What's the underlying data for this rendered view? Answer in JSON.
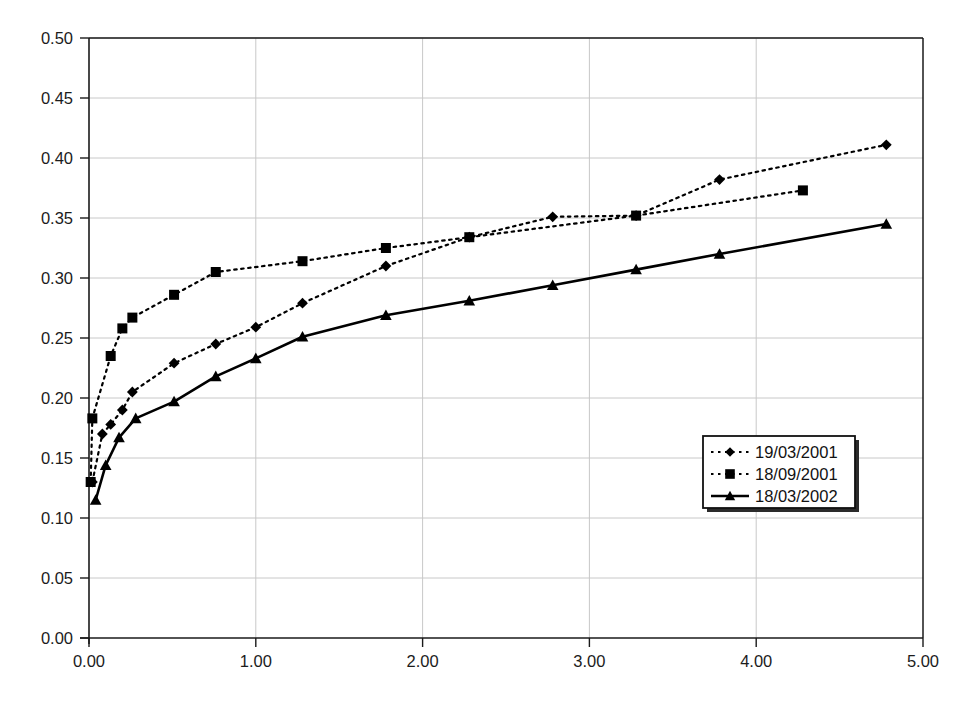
{
  "chart_data": {
    "type": "line",
    "title": "",
    "xlabel": "",
    "ylabel": "",
    "xlim": [
      0.0,
      5.0
    ],
    "ylim": [
      0.0,
      0.5
    ],
    "xticks": [
      "0.00",
      "1.00",
      "2.00",
      "3.00",
      "4.00",
      "5.00"
    ],
    "xtick_values": [
      0,
      1,
      2,
      3,
      4,
      5
    ],
    "yticks": [
      "0.00",
      "0.05",
      "0.10",
      "0.15",
      "0.20",
      "0.25",
      "0.30",
      "0.35",
      "0.40",
      "0.45",
      "0.50"
    ],
    "ytick_values": [
      0.0,
      0.05,
      0.1,
      0.15,
      0.2,
      0.25,
      0.3,
      0.35,
      0.4,
      0.45,
      0.5
    ],
    "grid": "horizontal-and-vertical",
    "legend_position": "center-right",
    "series": [
      {
        "name": "19/03/2001",
        "marker": "diamond",
        "linestyle": "dotted",
        "color": "#000000",
        "x": [
          0.02,
          0.08,
          0.13,
          0.2,
          0.26,
          0.51,
          0.76,
          1.0,
          1.28,
          1.78,
          2.28,
          2.78,
          3.28,
          3.78,
          4.78
        ],
        "y": [
          0.13,
          0.17,
          0.178,
          0.19,
          0.205,
          0.229,
          0.245,
          0.259,
          0.279,
          0.31,
          0.334,
          0.351,
          0.352,
          0.382,
          0.411
        ]
      },
      {
        "name": "18/09/2001",
        "marker": "square",
        "linestyle": "dotted",
        "color": "#000000",
        "x": [
          0.01,
          0.02,
          0.13,
          0.2,
          0.26,
          0.51,
          0.76,
          1.28,
          1.78,
          2.28,
          3.28,
          4.28
        ],
        "y": [
          0.13,
          0.183,
          0.235,
          0.258,
          0.267,
          0.286,
          0.305,
          0.314,
          0.325,
          0.334,
          0.352,
          0.373
        ]
      },
      {
        "name": "18/03/2002",
        "marker": "triangle",
        "linestyle": "solid",
        "color": "#000000",
        "x": [
          0.04,
          0.1,
          0.18,
          0.28,
          0.51,
          0.76,
          1.0,
          1.28,
          1.78,
          2.28,
          2.78,
          3.28,
          3.78,
          4.78
        ],
        "y": [
          0.115,
          0.144,
          0.167,
          0.183,
          0.197,
          0.218,
          0.233,
          0.251,
          0.269,
          0.281,
          0.294,
          0.307,
          0.32,
          0.345
        ]
      }
    ]
  },
  "legend": {
    "entries": [
      {
        "label": "19/03/2001"
      },
      {
        "label": "18/09/2001"
      },
      {
        "label": "18/03/2002"
      }
    ]
  },
  "caption": {
    "text": ""
  },
  "colors": {
    "axis": "#1a1a1a",
    "grid": "#c8c8c8",
    "plot_background": "#ffffff",
    "series": "#000000"
  }
}
